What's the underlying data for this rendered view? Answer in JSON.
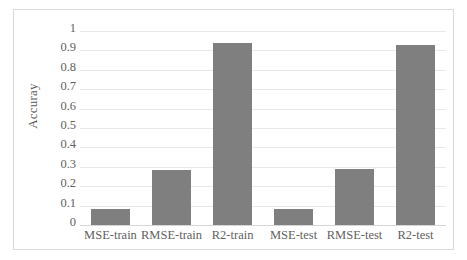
{
  "chart_data": {
    "type": "bar",
    "title": "",
    "xlabel": "",
    "ylabel": "Accuray",
    "categories": [
      "MSE-train",
      "RMSE-train",
      "R2-train",
      "MSE-test",
      "RMSE-test",
      "R2-test"
    ],
    "values": [
      0.082,
      0.286,
      0.937,
      0.085,
      0.291,
      0.928
    ],
    "ylim": [
      0,
      1
    ],
    "ytick_labels": [
      "1",
      "0.9",
      "0.8",
      "0.7",
      "0.6",
      "0.5",
      "0.4",
      "0.3",
      "0.2",
      "0.1",
      "0"
    ],
    "ytick_values": [
      1,
      0.9,
      0.8,
      0.7,
      0.6,
      0.5,
      0.4,
      0.3,
      0.2,
      0.1,
      0
    ],
    "grid": true,
    "grid_orientation": "horizontal",
    "legend": false,
    "legend_position": "none",
    "bar_color": "#7f7f7f",
    "grid_color": "#e8e8e8",
    "frame_color": "#d9d9d9",
    "text_color": "#5f5f5f",
    "background_color": "#ffffff"
  }
}
